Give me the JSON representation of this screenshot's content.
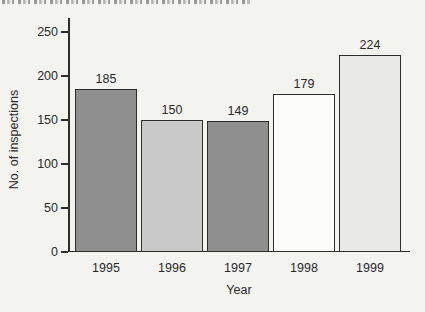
{
  "figure": {
    "ylabel": "No. of inspections",
    "xlabel": "Year"
  },
  "chart_data": {
    "type": "bar",
    "categories": [
      "1995",
      "1996",
      "1997",
      "1998",
      "1999"
    ],
    "values": [
      185,
      150,
      149,
      179,
      224
    ],
    "value_labels": [
      "185",
      "150",
      "149",
      "179",
      "224"
    ],
    "bar_colors": [
      "#8f8f8f",
      "#c9c9c9",
      "#8f8f8f",
      "#fcfcfb",
      "#e9e9e6"
    ],
    "bar_outline_color": "#2c2c2c",
    "title": "",
    "xlabel": "Year",
    "ylabel": "No. of inspections",
    "yticks": [
      0,
      50,
      100,
      150,
      200,
      250
    ],
    "ytick_labels": [
      "0",
      "50",
      "100",
      "150",
      "200",
      "250"
    ],
    "ylim": [
      0,
      250
    ],
    "grid": false,
    "legend": null,
    "background_color": "#f3f3f0"
  }
}
